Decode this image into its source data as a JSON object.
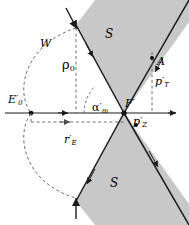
{
  "figure": {
    "type": "geometry-diagram",
    "width": 189,
    "height": 225,
    "background": "#ffffff",
    "shade_color": "#c8c8c8",
    "line_color": "#1a1a1a",
    "axis_color": "#8c8c8c",
    "dash_color": "#6e6e6e"
  },
  "labels": {
    "cone_upper": "S",
    "cone_lower": "S",
    "apex": "F",
    "apex_prime": "′",
    "left_point": "E",
    "left_point_sub": "0",
    "left_point_prime": "′",
    "arc": "W",
    "rho": "ρ",
    "rho_sub": "0",
    "angle": "α",
    "angle_sub": "m",
    "angle_prime": "′",
    "radius": "r",
    "radius_sub": "E",
    "radius_prime": "′",
    "point_a": "A",
    "p_transverse": "p",
    "p_transverse_sub": "T",
    "p_transverse_prime": "′",
    "p_longitudinal": "p",
    "p_longitudinal_sub": "Z",
    "p_longitudinal_prime": "′"
  },
  "geometry": {
    "apex": {
      "x": 124,
      "y": 113
    },
    "axis": {
      "x1": 5,
      "y1": 113,
      "x2": 176,
      "y2": 113
    },
    "axis_mid_arrow_x": 66,
    "e0_dot": {
      "x": 31,
      "y": 113
    },
    "cone_half_angle_deg": 43,
    "upper_left_edge": {
      "x": 76,
      "y": 25
    },
    "upper_right_edge": {
      "x": 186,
      "y": 22
    },
    "lower_left_edge": {
      "x": 76,
      "y": 201
    },
    "lower_right_edge": {
      "x": 186,
      "y": 204
    },
    "arc_top": {
      "x": 76,
      "y": 28
    },
    "arc_bottom": {
      "x": 76,
      "y": 198
    },
    "rho_line": {
      "x": 76,
      "y_top": 28,
      "y_bottom": 113
    },
    "re_line": {
      "y": 122,
      "x1": 31,
      "x2": 124
    },
    "pt_line": {
      "x": 152,
      "y_top": 58,
      "y_bottom": 113
    },
    "a_point": {
      "x": 152,
      "y": 58
    },
    "pz_dot": {
      "x": 136,
      "y": 125
    }
  }
}
